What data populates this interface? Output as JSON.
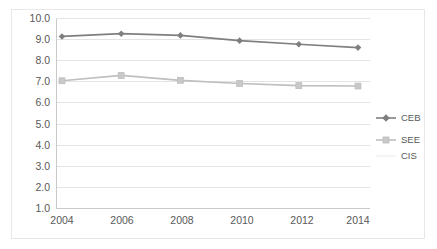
{
  "chart_data": {
    "type": "line",
    "title": "",
    "subtitle": "",
    "xlabel": "",
    "ylabel": "",
    "categories": [
      "2004",
      "2006",
      "2008",
      "2010",
      "2012",
      "2014"
    ],
    "x": [
      2004,
      2006,
      2008,
      2010,
      2012,
      2014
    ],
    "ylim": [
      1.0,
      10.0
    ],
    "ytick_step": 1.0,
    "ytick_labels": [
      "10.0",
      "9.0",
      "8.0",
      "7.0",
      "6.0",
      "5.0",
      "4.0",
      "3.0",
      "2.0",
      "1.0"
    ],
    "ytick_values": [
      10.0,
      9.0,
      8.0,
      7.0,
      6.0,
      5.0,
      4.0,
      3.0,
      2.0,
      1.0
    ],
    "grid": true,
    "grid_axis": "y",
    "legend_position": "right",
    "series": [
      {
        "name": "CEB",
        "color": "#7f7f7f",
        "marker": "diamond",
        "values": [
          9.15,
          9.28,
          9.2,
          8.95,
          8.78,
          8.62
        ]
      },
      {
        "name": "SEE",
        "color": "#bfbfbf",
        "marker": "square",
        "values": [
          7.05,
          7.3,
          7.07,
          6.92,
          6.82,
          6.8
        ]
      },
      {
        "name": "CIS",
        "color": "#f2f2f2",
        "marker": "none",
        "values": [
          null,
          null,
          null,
          null,
          null,
          null
        ]
      }
    ]
  },
  "legend": {
    "items": [
      {
        "label": "CEB"
      },
      {
        "label": "SEE"
      },
      {
        "label": "CIS"
      }
    ]
  },
  "axes": {
    "y": {
      "labels": [
        "10.0",
        "9.0",
        "8.0",
        "7.0",
        "6.0",
        "5.0",
        "4.0",
        "3.0",
        "2.0",
        "1.0"
      ]
    },
    "x": {
      "labels": [
        "2004",
        "2006",
        "2008",
        "2010",
        "2012",
        "2014"
      ]
    }
  },
  "colors": {
    "series_ceb": "#7f7f7f",
    "series_see": "#bfbfbf",
    "series_cis": "#f2f2f2",
    "gridline": "#e4e4e4",
    "frame": "#e8e8e8",
    "text": "#595959",
    "background": "#ffffff"
  }
}
